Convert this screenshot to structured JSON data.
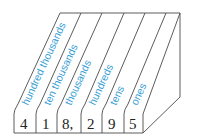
{
  "diagram": {
    "title": "",
    "colors": {
      "label": "#3a9fd6",
      "line": "#4a4a4a",
      "digit": "#222222",
      "background": "#ffffff"
    },
    "number": "418,295",
    "columns": [
      {
        "place": "hundred thousands",
        "digit": "4"
      },
      {
        "place": "ten thousands",
        "digit": "1"
      },
      {
        "place": "thousands",
        "digit": "8,"
      },
      {
        "place": "hundreds",
        "digit": "2"
      },
      {
        "place": "tens",
        "digit": "9"
      },
      {
        "place": "ones",
        "digit": "5"
      }
    ]
  }
}
